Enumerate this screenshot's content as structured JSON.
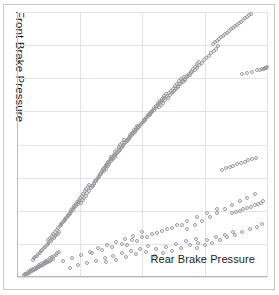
{
  "figure": {
    "background_color": "#ffffff",
    "frame_color": "#c8c8cc",
    "grid_color": "#dfe3ea",
    "marker_color": "#9a9a9e"
  },
  "axes": {
    "ylabel": "Front Brake Pressure",
    "xlabel": "Rear Brake Pressure",
    "right_note": "unreadable",
    "left_note": "unreadable"
  },
  "chart_data": {
    "type": "scatter",
    "title": "",
    "xlabel": "Rear Brake Pressure",
    "ylabel": "Front Brake Pressure",
    "grid": true,
    "legend": "none",
    "marker": "open-circle",
    "xlim": [
      0,
      100
    ],
    "ylim": [
      0,
      100
    ],
    "xticks": [
      0,
      25,
      50,
      75,
      100
    ],
    "yticks": [
      0,
      12.5,
      25,
      37.5,
      50,
      62.5,
      75,
      87.5,
      100
    ],
    "xtick_labels": [
      "",
      "",
      "",
      "",
      ""
    ],
    "ytick_labels": [
      "",
      "",
      "",
      "",
      "",
      "",
      "",
      "",
      ""
    ],
    "series": [
      {
        "name": "brake pressure samples",
        "x": [
          3.1,
          4.0,
          4.6,
          5.2,
          5.8,
          6.3,
          6.9,
          7.4,
          8.0,
          8.6,
          9.1,
          9.7,
          10.3,
          10.8,
          11.4,
          12.0,
          12.5,
          13.1,
          13.6,
          14.2,
          2.6,
          3.4,
          4.2,
          5.0,
          5.7,
          6.5,
          7.2,
          8.1,
          8.8,
          9.5,
          10.2,
          11.0,
          11.7,
          12.4,
          13.2,
          13.9,
          14.7,
          15.4,
          16.1,
          16.9,
          6.2,
          6.8,
          7.3,
          7.9,
          8.4,
          9.0,
          9.6,
          10.1,
          10.7,
          11.2,
          11.8,
          12.3,
          12.9,
          13.4,
          14.0,
          14.6,
          15.1,
          15.7,
          16.2,
          16.8,
          12.5,
          13.2,
          13.8,
          14.5,
          15.1,
          15.8,
          16.4,
          17.1,
          17.7,
          18.4,
          19.0,
          19.7,
          20.3,
          21.0,
          21.6,
          22.3,
          22.9,
          23.6,
          24.2,
          24.9,
          17.4,
          18.0,
          18.6,
          19.2,
          19.8,
          20.4,
          21.0,
          21.6,
          22.2,
          22.8,
          23.4,
          24.0,
          24.6,
          25.2,
          25.8,
          26.4,
          27.0,
          27.6,
          28.2,
          28.8,
          25.6,
          26.2,
          26.9,
          27.5,
          28.1,
          28.8,
          29.4,
          30.0,
          30.7,
          31.3,
          31.9,
          32.6,
          33.2,
          33.8,
          34.5,
          35.1,
          35.7,
          36.4,
          37.0,
          37.6,
          30.2,
          30.9,
          31.5,
          32.2,
          32.8,
          33.5,
          34.1,
          34.8,
          35.4,
          36.1,
          36.7,
          37.4,
          38.0,
          38.7,
          39.3,
          40.0,
          40.6,
          41.3,
          41.9,
          42.6,
          34.8,
          35.5,
          36.2,
          36.9,
          37.6,
          38.3,
          39.0,
          39.7,
          40.4,
          41.1,
          41.8,
          42.5,
          43.2,
          43.9,
          44.6,
          45.3,
          46.0,
          46.7,
          47.4,
          48.1,
          38.5,
          39.3,
          40.1,
          40.9,
          41.7,
          42.5,
          43.3,
          44.1,
          44.9,
          45.7,
          46.5,
          47.3,
          48.1,
          48.9,
          49.7,
          50.5,
          51.3,
          52.1,
          52.9,
          53.7,
          44.2,
          45.0,
          45.8,
          46.6,
          47.4,
          48.2,
          49.0,
          49.8,
          50.6,
          51.4,
          52.2,
          53.0,
          53.8,
          54.6,
          55.4,
          56.2,
          57.0,
          57.8,
          58.6,
          59.4,
          50.4,
          51.3,
          52.1,
          53.0,
          53.8,
          54.7,
          55.5,
          56.4,
          57.2,
          58.1,
          58.9,
          59.8,
          60.6,
          61.5,
          62.3,
          63.2,
          64.0,
          64.9,
          65.7,
          66.6,
          56.8,
          57.6,
          58.5,
          59.3,
          60.2,
          61.0,
          61.9,
          62.7,
          63.6,
          64.4,
          65.3,
          66.1,
          67.0,
          67.8,
          68.7,
          69.5,
          70.4,
          71.2,
          72.1,
          72.9,
          62.4,
          63.4,
          64.3,
          65.3,
          66.2,
          67.2,
          68.1,
          69.1,
          70.0,
          71.0,
          71.9,
          72.9,
          73.8,
          74.8,
          75.7,
          76.7,
          77.6,
          78.6,
          79.5,
          80.5,
          78.2,
          79.0,
          79.8,
          80.6,
          81.4,
          82.2,
          83.0,
          83.8,
          84.6,
          85.4,
          86.2,
          87.0,
          87.8,
          88.6,
          89.4,
          90.2,
          91.0,
          91.8,
          92.6,
          93.4,
          18.5,
          22.0,
          25.5,
          29.0,
          32.5,
          36.0,
          39.5,
          43.0,
          46.5,
          50.0,
          21.0,
          24.5,
          28.0,
          31.5,
          35.0,
          38.5,
          42.0,
          45.5,
          49.0,
          52.5,
          30.0,
          34.0,
          38.0,
          42.0,
          46.0,
          50.0,
          54.0,
          58.0,
          62.0,
          66.0,
          35.5,
          39.5,
          43.5,
          47.5,
          51.5,
          55.5,
          59.5,
          63.5,
          67.5,
          71.5,
          44.0,
          48.0,
          52.0,
          56.0,
          60.0,
          64.0,
          68.0,
          72.0,
          76.0,
          80.0,
          55.0,
          58.5,
          62.0,
          65.5,
          69.0,
          72.5,
          76.0,
          79.5,
          83.0,
          86.5,
          68.0,
          71.0,
          74.0,
          77.0,
          80.0,
          83.0,
          86.0,
          89.0,
          92.0,
          95.0,
          72.0,
          75.0,
          78.0,
          81.0,
          84.0,
          87.0,
          90.0,
          93.0,
          96.0,
          98.0,
          82.0,
          83.5,
          85.0,
          86.5,
          88.0,
          89.5,
          91.0,
          92.5,
          94.0,
          95.5,
          86.0,
          87.5,
          89.0,
          90.5,
          92.0,
          93.5,
          95.0,
          96.5,
          97.5,
          98.5,
          90.0,
          92.0,
          94.0,
          96.0,
          97.0,
          98.0,
          98.8,
          99.2,
          99.6,
          99.9
        ],
        "y": [
          1.0,
          1.3,
          1.6,
          1.9,
          2.2,
          2.5,
          2.8,
          3.1,
          3.4,
          3.7,
          4.0,
          4.3,
          4.6,
          4.9,
          5.2,
          5.5,
          5.8,
          6.1,
          6.4,
          6.7,
          0.8,
          1.2,
          1.7,
          2.1,
          2.6,
          3.0,
          3.5,
          3.9,
          4.4,
          4.8,
          5.3,
          5.7,
          6.2,
          6.6,
          7.1,
          7.5,
          8.0,
          8.4,
          8.9,
          9.3,
          6.5,
          7.0,
          7.6,
          8.1,
          8.7,
          9.2,
          9.8,
          10.3,
          10.9,
          11.4,
          12.0,
          12.5,
          13.1,
          13.6,
          14.2,
          14.7,
          15.3,
          15.8,
          16.4,
          16.9,
          14.0,
          14.8,
          15.5,
          16.3,
          17.0,
          17.8,
          18.5,
          19.3,
          20.0,
          20.8,
          21.5,
          22.3,
          23.0,
          23.8,
          24.5,
          25.3,
          26.0,
          26.8,
          27.5,
          28.3,
          19.5,
          20.3,
          21.1,
          21.9,
          22.7,
          23.5,
          24.3,
          25.1,
          25.9,
          26.7,
          27.5,
          28.3,
          29.1,
          29.9,
          30.7,
          31.5,
          32.3,
          33.1,
          33.9,
          34.7,
          28.0,
          28.9,
          29.8,
          30.7,
          31.6,
          32.5,
          33.4,
          34.3,
          35.2,
          36.1,
          37.0,
          37.9,
          38.8,
          39.7,
          40.6,
          41.5,
          42.4,
          43.3,
          44.2,
          45.1,
          34.5,
          35.4,
          36.3,
          37.2,
          38.1,
          39.0,
          39.9,
          40.8,
          41.7,
          42.6,
          43.5,
          44.4,
          45.3,
          46.2,
          47.1,
          48.0,
          48.9,
          49.8,
          50.7,
          51.6,
          40.0,
          40.9,
          41.8,
          42.7,
          43.6,
          44.5,
          45.4,
          46.3,
          47.2,
          48.1,
          49.0,
          49.9,
          50.8,
          51.7,
          52.6,
          53.5,
          54.4,
          55.3,
          56.2,
          57.1,
          45.0,
          45.9,
          46.8,
          47.7,
          48.6,
          49.5,
          50.4,
          51.3,
          52.2,
          53.1,
          54.0,
          54.9,
          55.8,
          56.7,
          57.6,
          58.5,
          59.4,
          60.3,
          61.2,
          62.1,
          52.0,
          52.9,
          53.8,
          54.7,
          55.6,
          56.5,
          57.4,
          58.3,
          59.2,
          60.1,
          61.0,
          61.9,
          62.8,
          63.7,
          64.6,
          65.5,
          66.4,
          67.3,
          68.2,
          69.1,
          58.5,
          59.4,
          60.3,
          61.2,
          62.1,
          63.0,
          63.9,
          64.8,
          65.7,
          66.6,
          67.5,
          68.4,
          69.3,
          70.2,
          71.1,
          72.0,
          72.9,
          73.8,
          74.7,
          75.6,
          64.0,
          64.9,
          65.8,
          66.7,
          67.6,
          68.5,
          69.4,
          70.3,
          71.2,
          72.1,
          73.0,
          73.9,
          74.8,
          75.7,
          76.6,
          77.5,
          78.4,
          79.3,
          80.2,
          81.1,
          70.0,
          70.9,
          71.8,
          72.7,
          73.6,
          74.5,
          75.4,
          76.3,
          77.2,
          78.1,
          79.0,
          79.9,
          80.8,
          81.7,
          82.6,
          83.5,
          84.4,
          85.3,
          86.2,
          87.1,
          88.0,
          88.6,
          89.2,
          89.8,
          90.4,
          91.0,
          91.6,
          92.2,
          92.8,
          93.4,
          94.0,
          94.6,
          95.2,
          95.8,
          96.4,
          97.0,
          97.6,
          98.2,
          98.8,
          99.4,
          6.0,
          7.2,
          8.4,
          9.6,
          10.8,
          12.0,
          13.2,
          14.4,
          15.6,
          16.8,
          3.5,
          4.4,
          5.3,
          6.2,
          7.1,
          8.0,
          8.9,
          9.8,
          10.7,
          11.6,
          9.0,
          10.2,
          11.4,
          12.6,
          13.8,
          15.0,
          16.2,
          17.4,
          18.6,
          19.8,
          5.5,
          6.5,
          7.5,
          8.5,
          9.5,
          10.5,
          11.5,
          12.5,
          13.5,
          14.5,
          12.0,
          13.5,
          15.0,
          16.5,
          18.0,
          19.5,
          21.0,
          22.5,
          24.0,
          25.5,
          8.0,
          9.0,
          10.0,
          11.0,
          12.0,
          13.0,
          14.0,
          15.0,
          16.0,
          17.0,
          18.0,
          19.5,
          21.0,
          22.5,
          24.0,
          25.5,
          27.0,
          28.5,
          30.0,
          31.5,
          11.0,
          12.0,
          13.0,
          14.0,
          15.0,
          16.0,
          17.0,
          18.0,
          19.0,
          20.0,
          40.5,
          41.0,
          41.5,
          42.0,
          42.5,
          43.0,
          43.5,
          44.0,
          44.5,
          45.0,
          24.0,
          24.5,
          25.0,
          25.5,
          26.0,
          26.5,
          27.0,
          27.5,
          28.0,
          28.5,
          76.5,
          77.0,
          77.5,
          78.0,
          78.2,
          78.4,
          78.6,
          78.8,
          79.0,
          79.2
        ]
      }
    ]
  }
}
